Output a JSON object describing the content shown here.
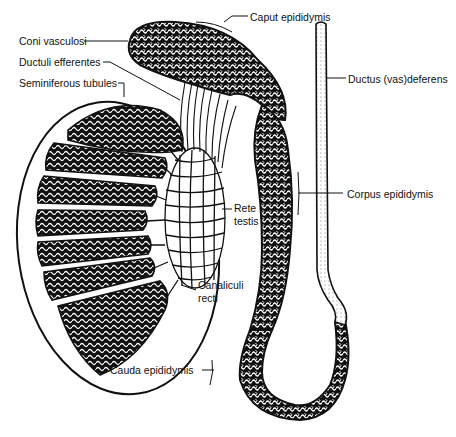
{
  "diagram": {
    "ink_color": "#111111",
    "background": "#ffffff",
    "labels": {
      "coni_vasculosi": "Coni vasculosi",
      "ductuli_efferentes": "Ductuli efferentes",
      "seminiferous_tubules": "Seminiferous tubules",
      "caput_epididymis": "Caput epididymis",
      "ductus_deferens": "Ductus (vas)deferens",
      "corpus_epididymis": "Corpus epididymis",
      "rete_testis_line1": "Rete",
      "rete_testis_line2": "testis",
      "canaliculi_recti_line1": "Canaliculi",
      "canaliculi_recti_line2": "recti",
      "cauda_epididymis": "Cauda epididymis"
    }
  }
}
